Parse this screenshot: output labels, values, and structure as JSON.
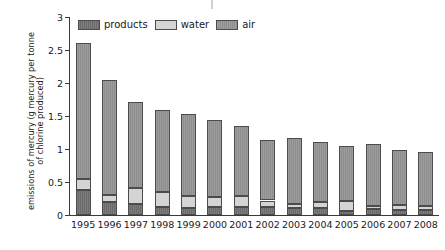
{
  "chart_data": {
    "type": "bar",
    "stacked": true,
    "title": "",
    "subtitle": "",
    "xlabel": "",
    "ylabel": "emissions of mercury (g mercury per tonne of chlorine produced)",
    "ylabel_lines": [
      "emissions of mercury (g mercury per tonne",
      "of chlorine produced)"
    ],
    "categories": [
      "1995",
      "1996",
      "1997",
      "1998",
      "1999",
      "2000",
      "2001",
      "2002",
      "2003",
      "2004",
      "2005",
      "2006",
      "2007",
      "2008"
    ],
    "series": [
      {
        "name": "products",
        "color": "#6a6a6a",
        "values": [
          0.38,
          0.2,
          0.17,
          0.12,
          0.11,
          0.12,
          0.12,
          0.12,
          0.1,
          0.1,
          0.06,
          0.09,
          0.07,
          0.08
        ]
      },
      {
        "name": "water",
        "color": "#d4d4d4",
        "values": [
          0.16,
          0.1,
          0.24,
          0.23,
          0.18,
          0.16,
          0.17,
          0.1,
          0.06,
          0.1,
          0.15,
          0.05,
          0.08,
          0.06
        ]
      },
      {
        "name": "air",
        "color": "#8e8e8e",
        "values": [
          2.07,
          1.74,
          1.31,
          1.24,
          1.24,
          1.16,
          1.06,
          0.91,
          1.0,
          0.91,
          0.83,
          0.93,
          0.83,
          0.81
        ]
      }
    ],
    "totals": [
      2.61,
      2.04,
      1.72,
      1.59,
      1.53,
      1.44,
      1.35,
      1.13,
      1.16,
      1.11,
      1.04,
      1.07,
      0.98,
      0.95
    ],
    "ylim": [
      0,
      3
    ],
    "yticks": [
      0,
      0.5,
      1,
      1.5,
      2,
      2.5,
      3
    ],
    "ytick_labels": [
      "0",
      "0.5",
      "1",
      "1.5",
      "2",
      "2.5",
      "3"
    ],
    "grid": false,
    "legend_position": "top-left",
    "legend": [
      {
        "label": "products",
        "color": "#6a6a6a",
        "style": "hatched"
      },
      {
        "label": "water",
        "color": "#d4d4d4",
        "style": "plain"
      },
      {
        "label": "air",
        "color": "#8e8e8e",
        "style": "hatched"
      }
    ]
  }
}
